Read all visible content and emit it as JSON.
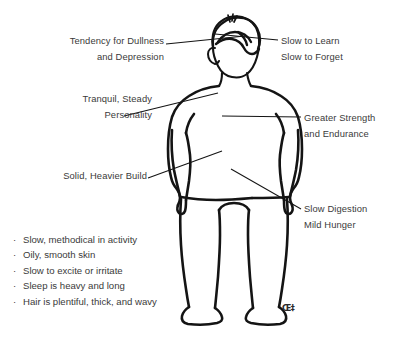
{
  "diagram": {
    "background_color": "#ffffff",
    "line_color": "#1a1a1a",
    "text_color": "#3a3a3a"
  },
  "callouts": {
    "dullness": {
      "line1": "Tendency for Dullness",
      "line2": "and Depression"
    },
    "learn": {
      "line1": "Slow to Learn",
      "line2": "Slow to Forget"
    },
    "tranquil": {
      "line1": "Tranquil, Steady",
      "line2": "Personality"
    },
    "strength": {
      "line1": "Greater Strength",
      "line2": "and Endurance"
    },
    "build": {
      "line1": "Solid, Heavier Build",
      "line2": ""
    },
    "digestion": {
      "line1": "Slow Digestion",
      "line2": "Mild Hunger"
    }
  },
  "trait_list": {
    "bullet_glyph": "·",
    "items": [
      "Slow, methodical in activity",
      "Oily, smooth skin",
      "Slow to excite or irritate",
      "Sleep is heavy and long",
      "Hair is plentiful, thick, and wavy"
    ]
  },
  "signature": {
    "mark": "Œ‡"
  }
}
